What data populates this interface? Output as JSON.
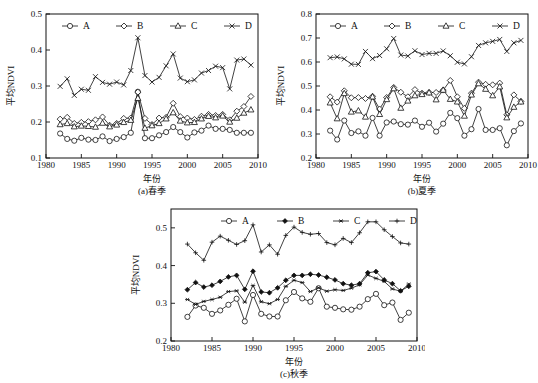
{
  "figure": {
    "name": "seasonal-mean-ndvi-trends",
    "y_axis_label": "平均NDVI",
    "x_axis_label": "年份"
  },
  "chart_data": [
    {
      "type": "line",
      "panel_id": "a",
      "title": "(a)春季",
      "xlabel": "年份",
      "ylabel": "平均NDVI",
      "xlim": [
        1980,
        2010
      ],
      "ylim": [
        0.1,
        0.5
      ],
      "xticks": [
        1980,
        1985,
        1990,
        1995,
        2000,
        2005,
        2010
      ],
      "yticks": [
        0.1,
        0.2,
        0.3,
        0.4,
        0.5
      ],
      "grid": false,
      "legend_position": "top-center",
      "x": [
        1982,
        1983,
        1984,
        1985,
        1986,
        1987,
        1988,
        1989,
        1990,
        1991,
        1992,
        1993,
        1994,
        1995,
        1996,
        1997,
        1998,
        1999,
        2000,
        2001,
        2002,
        2003,
        2004,
        2005,
        2006,
        2007,
        2008,
        2009
      ],
      "series": [
        {
          "name": "A",
          "marker": "circle",
          "values": [
            0.168,
            0.153,
            0.148,
            0.156,
            0.151,
            0.15,
            0.16,
            0.147,
            0.153,
            0.158,
            0.17,
            0.284,
            0.155,
            0.155,
            0.163,
            0.172,
            0.186,
            0.172,
            0.157,
            0.171,
            0.176,
            0.19,
            0.181,
            0.181,
            0.178,
            0.17,
            0.17,
            0.17
          ]
        },
        {
          "name": "B",
          "marker": "diamond",
          "values": [
            0.208,
            0.213,
            0.196,
            0.199,
            0.201,
            0.206,
            0.214,
            0.191,
            0.196,
            0.21,
            0.211,
            0.283,
            0.21,
            0.193,
            0.211,
            0.213,
            0.252,
            0.215,
            0.211,
            0.207,
            0.216,
            0.221,
            0.218,
            0.221,
            0.206,
            0.23,
            0.243,
            0.271
          ]
        },
        {
          "name": "C",
          "marker": "triangle",
          "values": [
            0.193,
            0.196,
            0.187,
            0.189,
            0.188,
            0.186,
            0.197,
            0.187,
            0.192,
            0.199,
            0.205,
            0.266,
            0.183,
            0.19,
            0.196,
            0.209,
            0.226,
            0.203,
            0.198,
            0.199,
            0.209,
            0.216,
            0.212,
            0.217,
            0.2,
            0.211,
            0.225,
            0.234
          ]
        },
        {
          "name": "D",
          "marker": "x",
          "values": [
            0.299,
            0.32,
            0.274,
            0.291,
            0.288,
            0.326,
            0.31,
            0.305,
            0.311,
            0.303,
            0.343,
            0.434,
            0.329,
            0.311,
            0.324,
            0.356,
            0.389,
            0.322,
            0.312,
            0.317,
            0.336,
            0.343,
            0.355,
            0.351,
            0.292,
            0.372,
            0.375,
            0.358
          ]
        }
      ]
    },
    {
      "type": "line",
      "panel_id": "b",
      "title": "(b)夏季",
      "xlabel": "年份",
      "ylabel": "平均NDVI",
      "xlim": [
        1980,
        2010
      ],
      "ylim": [
        0.2,
        0.8
      ],
      "xticks": [
        1980,
        1985,
        1990,
        1995,
        2000,
        2005,
        2010
      ],
      "yticks": [
        0.2,
        0.3,
        0.4,
        0.5,
        0.6,
        0.7,
        0.8
      ],
      "grid": false,
      "legend_position": "top-center",
      "x": [
        1982,
        1983,
        1984,
        1985,
        1986,
        1987,
        1988,
        1989,
        1990,
        1991,
        1992,
        1993,
        1994,
        1995,
        1996,
        1997,
        1998,
        1999,
        2000,
        2001,
        2002,
        2003,
        2004,
        2005,
        2006,
        2007,
        2008,
        2009
      ],
      "series": [
        {
          "name": "A",
          "marker": "circle",
          "values": [
            0.314,
            0.277,
            0.356,
            0.304,
            0.311,
            0.293,
            0.367,
            0.293,
            0.348,
            0.352,
            0.341,
            0.339,
            0.356,
            0.33,
            0.347,
            0.31,
            0.343,
            0.388,
            0.366,
            0.293,
            0.32,
            0.404,
            0.317,
            0.317,
            0.324,
            0.253,
            0.312,
            0.344
          ]
        },
        {
          "name": "B",
          "marker": "diamond",
          "values": [
            0.455,
            0.433,
            0.48,
            0.451,
            0.452,
            0.448,
            0.457,
            0.404,
            0.452,
            0.494,
            0.474,
            0.455,
            0.485,
            0.47,
            0.473,
            0.473,
            0.483,
            0.523,
            0.455,
            0.407,
            0.47,
            0.516,
            0.507,
            0.505,
            0.512,
            0.38,
            0.463,
            0.436
          ]
        },
        {
          "name": "C",
          "marker": "triangle",
          "values": [
            0.43,
            0.364,
            0.469,
            0.392,
            0.397,
            0.371,
            0.455,
            0.382,
            0.444,
            0.489,
            0.408,
            0.438,
            0.46,
            0.465,
            0.472,
            0.443,
            0.483,
            0.445,
            0.434,
            0.375,
            0.463,
            0.51,
            0.487,
            0.46,
            0.497,
            0.368,
            0.412,
            0.434
          ]
        },
        {
          "name": "D",
          "marker": "x",
          "values": [
            0.618,
            0.621,
            0.613,
            0.591,
            0.59,
            0.644,
            0.614,
            0.627,
            0.655,
            0.698,
            0.629,
            0.625,
            0.647,
            0.631,
            0.636,
            0.636,
            0.646,
            0.626,
            0.599,
            0.592,
            0.622,
            0.669,
            0.68,
            0.686,
            0.694,
            0.644,
            0.68,
            0.69
          ]
        }
      ]
    },
    {
      "type": "line",
      "panel_id": "c",
      "title": "(c)秋季",
      "xlabel": "年份",
      "ylabel": "平均NDVI",
      "xlim": [
        1980,
        2010
      ],
      "ylim": [
        0.2,
        0.55
      ],
      "xticks": [
        1980,
        1985,
        1990,
        1995,
        2000,
        2005,
        2010
      ],
      "yticks": [
        0.2,
        0.3,
        0.4,
        0.5
      ],
      "grid": false,
      "legend_position": "top-center",
      "x": [
        1982,
        1983,
        1984,
        1985,
        1986,
        1987,
        1988,
        1989,
        1990,
        1991,
        1992,
        1993,
        1994,
        1995,
        1996,
        1997,
        1998,
        1999,
        2000,
        2001,
        2002,
        2003,
        2004,
        2005,
        2006,
        2007,
        2008,
        2009
      ],
      "series": [
        {
          "name": "A",
          "marker": "circle",
          "values": [
            0.264,
            0.294,
            0.288,
            0.272,
            0.281,
            0.296,
            0.312,
            0.252,
            0.322,
            0.272,
            0.265,
            0.265,
            0.308,
            0.33,
            0.313,
            0.304,
            0.34,
            0.291,
            0.288,
            0.284,
            0.283,
            0.291,
            0.311,
            0.325,
            0.295,
            0.302,
            0.256,
            0.275
          ]
        },
        {
          "name": "B",
          "marker": "diamond-filled",
          "values": [
            0.336,
            0.355,
            0.343,
            0.348,
            0.358,
            0.37,
            0.374,
            0.337,
            0.385,
            0.33,
            0.328,
            0.341,
            0.361,
            0.374,
            0.374,
            0.377,
            0.375,
            0.369,
            0.362,
            0.352,
            0.348,
            0.352,
            0.381,
            0.384,
            0.362,
            0.352,
            0.333,
            0.345
          ]
        },
        {
          "name": "C",
          "marker": "star",
          "values": [
            0.31,
            0.297,
            0.305,
            0.31,
            0.316,
            0.331,
            0.333,
            0.303,
            0.347,
            0.304,
            0.299,
            0.31,
            0.345,
            0.361,
            0.355,
            0.331,
            0.341,
            0.332,
            0.336,
            0.334,
            0.34,
            0.349,
            0.375,
            0.366,
            0.358,
            0.338,
            0.332,
            0.351
          ]
        },
        {
          "name": "D",
          "marker": "plus",
          "values": [
            0.457,
            0.434,
            0.414,
            0.462,
            0.478,
            0.467,
            0.456,
            0.466,
            0.508,
            0.436,
            0.455,
            0.43,
            0.48,
            0.502,
            0.488,
            0.483,
            0.485,
            0.461,
            0.455,
            0.472,
            0.461,
            0.487,
            0.516,
            0.516,
            0.495,
            0.477,
            0.46,
            0.457
          ]
        }
      ]
    }
  ]
}
